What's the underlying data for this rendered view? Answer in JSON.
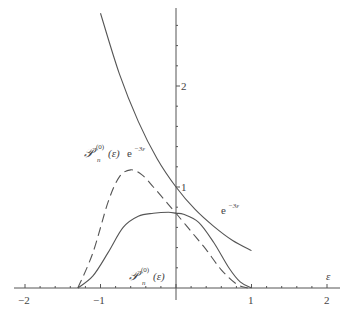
{
  "chart_data": {
    "type": "line",
    "title": "",
    "xlabel": "ε",
    "ylabel": "",
    "xlim": [
      -2.1,
      2.2
    ],
    "ylim": [
      -0.1,
      2.8
    ],
    "grid": false,
    "x_ticks": [
      "−2",
      "−1",
      "1",
      "2"
    ],
    "y_ticks": [
      "1",
      "2"
    ],
    "series": [
      {
        "name": "e^{-3ε}",
        "style": "solid",
        "x": [
          -1.0,
          -0.75,
          -0.5,
          -0.25,
          0.0,
          0.25,
          0.5,
          0.75,
          1.0
        ],
        "y": [
          2.72,
          2.12,
          1.65,
          1.28,
          1.0,
          0.78,
          0.61,
          0.47,
          0.37
        ]
      },
      {
        "name": "P_n^{(0)}(ε) e^{-3ε}",
        "style": "dashed",
        "x": [
          -1.3,
          -1.1,
          -0.9,
          -0.75,
          -0.6,
          -0.45,
          -0.3,
          -0.15,
          0.0,
          0.2,
          0.4,
          0.6,
          0.8,
          0.95
        ],
        "y": [
          0.0,
          0.35,
          0.85,
          1.1,
          1.17,
          1.12,
          1.0,
          0.87,
          0.74,
          0.56,
          0.38,
          0.18,
          0.04,
          0.0
        ]
      },
      {
        "name": "P_n^{(0)}(ε)",
        "style": "solid",
        "x": [
          -1.3,
          -1.1,
          -0.9,
          -0.7,
          -0.5,
          -0.3,
          -0.1,
          0.0,
          0.1,
          0.3,
          0.5,
          0.7,
          0.85,
          1.0
        ],
        "y": [
          0.0,
          0.12,
          0.35,
          0.6,
          0.71,
          0.74,
          0.75,
          0.74,
          0.73,
          0.65,
          0.45,
          0.2,
          0.06,
          0.0
        ]
      }
    ],
    "annotations": [
      {
        "text": "e^{-3ε}",
        "x": 0.55,
        "y": 0.8
      },
      {
        "text": "P_n^{(0)}(ε)e^{-3ε}",
        "x": -1.2,
        "y": 1.35
      },
      {
        "text": "P_n^{(0)}(ε)",
        "x": -0.7,
        "y": 0.12
      }
    ]
  },
  "labels": {
    "x_axis_var": "ε",
    "tick_m2": "−2",
    "tick_m1": "−1",
    "tick_1": "1",
    "tick_2": "2",
    "ytick_1": "1",
    "ytick_2": "2",
    "exp_base": "e",
    "exp_sup": "−3ε",
    "p_script": "𝒫",
    "p_sup": "(0)",
    "p_sub": "n",
    "p_arg": "(ε)"
  }
}
